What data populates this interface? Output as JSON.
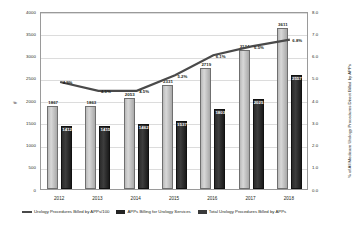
{
  "chart_data": {
    "type": "bar",
    "title": "",
    "xlabel": "",
    "ylabel": "#",
    "ylabel_right": "% of All Medicare Urology Procedures Direct Billed by APPs",
    "categories": [
      "2012",
      "2013",
      "2014",
      "2015",
      "2016",
      "2017",
      "2018"
    ],
    "ylim": [
      0,
      4000
    ],
    "yticks": [
      "4000",
      "3500",
      "3000",
      "2500",
      "2000",
      "1500",
      "1000",
      "500",
      "0"
    ],
    "ylim_right": [
      0.0,
      8.0
    ],
    "yticks_right": [
      "8.0",
      "7.0",
      "6.0",
      "5.0",
      "4.0",
      "3.0",
      "2.0",
      "1.0",
      "0.0"
    ],
    "grid": true,
    "legend_position": "bottom",
    "series": [
      {
        "name": "Urology Procedures Billed by APPs/100",
        "type": "line",
        "axis": "right",
        "values": [
          4.9,
          4.5,
          4.5,
          5.2,
          6.1,
          6.5,
          6.8
        ],
        "labels": [
          "4.9%",
          "4.5%",
          "4.5%",
          "5.2%",
          "6.1%",
          "6.5%",
          "6.8%"
        ]
      },
      {
        "name": "APPs Billing for Urology Services",
        "type": "bar",
        "axis": "left",
        "values": [
          1867,
          1863,
          2053,
          2331,
          2719,
          3124,
          3611
        ],
        "labels": [
          "1867",
          "1863",
          "2053",
          "2331",
          "2719",
          "3124",
          "3611"
        ]
      },
      {
        "name": "Total Urology Procedures Billed by APPs",
        "type": "bar",
        "axis": "left",
        "values": [
          1412,
          1415,
          1462,
          1537,
          1803,
          2025,
          2557
        ],
        "labels": [
          "1412",
          "1415",
          "1462",
          "1537",
          "1803",
          "2025",
          "2557"
        ]
      }
    ],
    "colors": {
      "light_bar": "#c0c0c0",
      "dark_bar": "#262626",
      "line": "#4a4a4a",
      "grid": "#dcdcdc",
      "frame": "#9a9a9a"
    }
  }
}
